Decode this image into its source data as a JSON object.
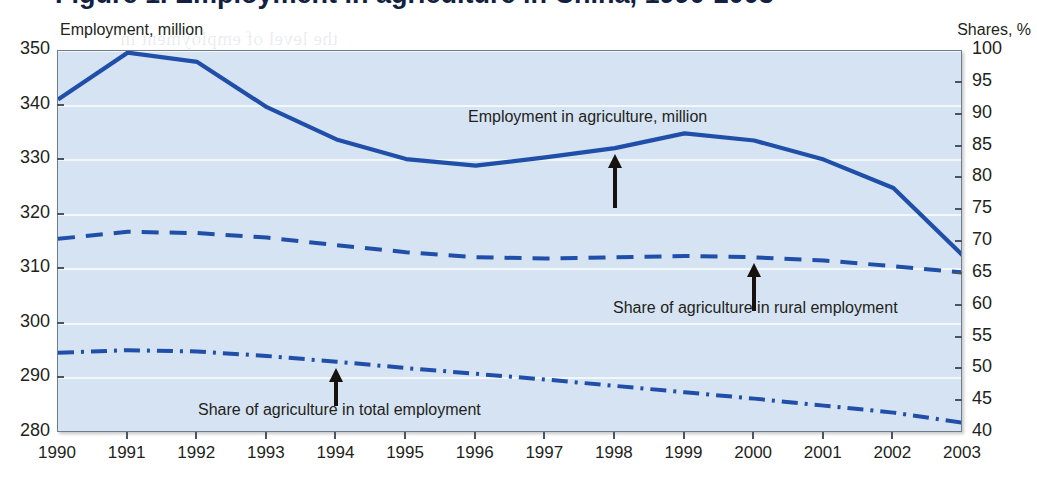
{
  "figure": {
    "title_partial": "Figure 1. Employment in agriculture in China, 1990-2003",
    "left_axis_caption": "Employment, million",
    "right_axis_caption": "Shares, %"
  },
  "bleed_text": [
    "the level of employment in",
    "at a slower rate than output",
    "agriculture in total employment",
    "has declined from 52 per cent in",
    "more than 40 per cent of China's",
    "labour force is still engaged in",
    "agricultural production, which",
    "generates only about 15 per cent",
    "of GDP. A substantial part of",
    "rural employment"
  ],
  "chart_data": {
    "type": "line",
    "title": "Employment in agriculture in China, 1990-2003",
    "xlabel": "",
    "ylabel": "Employment, million",
    "y2label": "Shares, %",
    "grid": true,
    "legend": "annotations-with-arrows",
    "x": [
      1990,
      1991,
      1992,
      1993,
      1994,
      1995,
      1996,
      1997,
      1998,
      1999,
      2000,
      2001,
      2002,
      2003
    ],
    "xlim": [
      1990,
      2003
    ],
    "ylim": [
      280,
      350
    ],
    "y2lim": [
      40,
      100
    ],
    "yticks": [
      280,
      290,
      300,
      310,
      320,
      330,
      340,
      350
    ],
    "y2ticks": [
      40,
      45,
      50,
      55,
      60,
      65,
      70,
      75,
      80,
      85,
      90,
      95,
      100
    ],
    "xticks": [
      "1990",
      "1991",
      "1992",
      "1993",
      "1994",
      "1995",
      "1996",
      "1997",
      "1998",
      "1999",
      "2000",
      "2001",
      "2002",
      "2003"
    ],
    "series": [
      {
        "name": "Employment in agriculture, million",
        "axis": "left",
        "style": "solid",
        "color": "#1f4fa8",
        "values": [
          341.1,
          349.7,
          348.0,
          339.7,
          333.8,
          330.2,
          329.0,
          330.5,
          332.2,
          334.9,
          333.6,
          330.1,
          324.9,
          312.5
        ]
      },
      {
        "name": "Share of agriculture in rural employment",
        "axis": "right",
        "style": "dashed",
        "color": "#1f4fa8",
        "values": [
          70.5,
          71.6,
          71.4,
          70.7,
          69.5,
          68.4,
          67.6,
          67.4,
          67.6,
          67.8,
          67.6,
          67.1,
          66.2,
          65.2
        ]
      },
      {
        "name": "Share of agriculture in total employment",
        "axis": "right",
        "style": "dashdot",
        "color": "#1f4fa8",
        "values": [
          52.6,
          53.0,
          52.8,
          52.1,
          51.2,
          50.2,
          49.3,
          48.4,
          47.4,
          46.4,
          45.4,
          44.3,
          43.2,
          41.6
        ]
      }
    ],
    "annotations": [
      {
        "id": "annot-employment",
        "text": "Employment in agriculture, million",
        "arrow": "down",
        "target_series": "Employment in agriculture, million",
        "target_x": 1998
      },
      {
        "id": "annot-rural-share",
        "text": "Share of agriculture in rural employment",
        "arrow": "up",
        "target_series": "Share of agriculture in rural employment",
        "target_x": 2000
      },
      {
        "id": "annot-total-share",
        "text": "Share of agriculture in total employment",
        "arrow": "up",
        "target_series": "Share of agriculture in total employment",
        "target_x": 1994
      }
    ],
    "colors": {
      "plot_background": "#d6e3f2",
      "line": "#1f4fa8",
      "gridline": "#f2f7fc",
      "border": "#6f7c8c",
      "text": "#231f20"
    }
  }
}
